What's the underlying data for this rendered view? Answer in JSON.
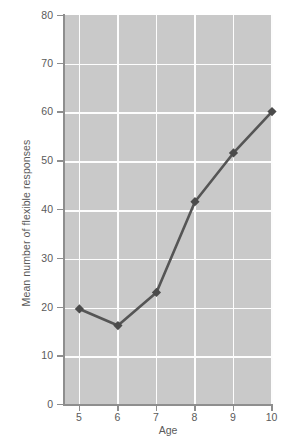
{
  "chart_data": {
    "type": "line",
    "title": "",
    "xlabel": "Age",
    "ylabel": "Mean number of flexible responses",
    "categories": [
      5,
      6,
      7,
      8,
      9,
      10
    ],
    "x": [
      5,
      6,
      7,
      8,
      9,
      10
    ],
    "values": [
      19.7,
      16.3,
      23.1,
      41.7,
      51.7,
      60.2
    ],
    "series": [
      {
        "name": "Mean number of flexible responses",
        "values": [
          19.7,
          16.3,
          23.1,
          41.7,
          51.7,
          60.2
        ]
      }
    ],
    "xlim": [
      4.6,
      10.0
    ],
    "ylim": [
      0,
      80
    ],
    "xticks": [
      "5",
      "6",
      "7",
      "8",
      "9",
      "10"
    ],
    "yticks": [
      "0",
      "10",
      "20",
      "30",
      "40",
      "50",
      "60",
      "70",
      "80"
    ],
    "grid": true,
    "legend": "none",
    "marker": "diamond",
    "line_color": "#555555",
    "marker_color": "#4b4b4b",
    "plot_background": "#c9c9c9",
    "gridline_color": "#fdfdfd",
    "axis_color": "#8e8e8e",
    "text_color": "#5a5a5a"
  }
}
